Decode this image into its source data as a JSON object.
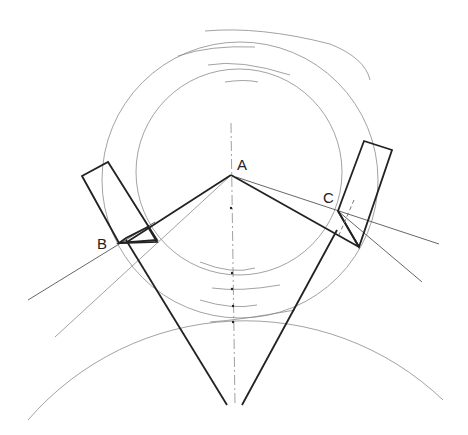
{
  "figure": {
    "width": 468,
    "height": 435,
    "background": "#ffffff",
    "line_color": "#222222",
    "construction_color": "#8a8a8a"
  },
  "labels": {
    "A": "A",
    "B": "B",
    "C": "C"
  },
  "points": {
    "A": [
      231,
      175
    ],
    "B": [
      119,
      243
    ],
    "B2": [
      157,
      242
    ],
    "C": [
      338,
      211
    ],
    "C2": [
      359,
      247
    ],
    "apex_left": [
      227,
      405
    ],
    "apex_right": [
      242,
      405
    ]
  },
  "circles": {
    "inner": {
      "cx": 239,
      "cy": 172,
      "r": 103
    },
    "outer": {
      "cx": 240,
      "cy": 180,
      "r": 138
    },
    "lower_arc": {
      "cx": 236,
      "cy": 495,
      "r": 287
    }
  },
  "axis": {
    "x": 231,
    "y1": 123,
    "y2": 405
  }
}
